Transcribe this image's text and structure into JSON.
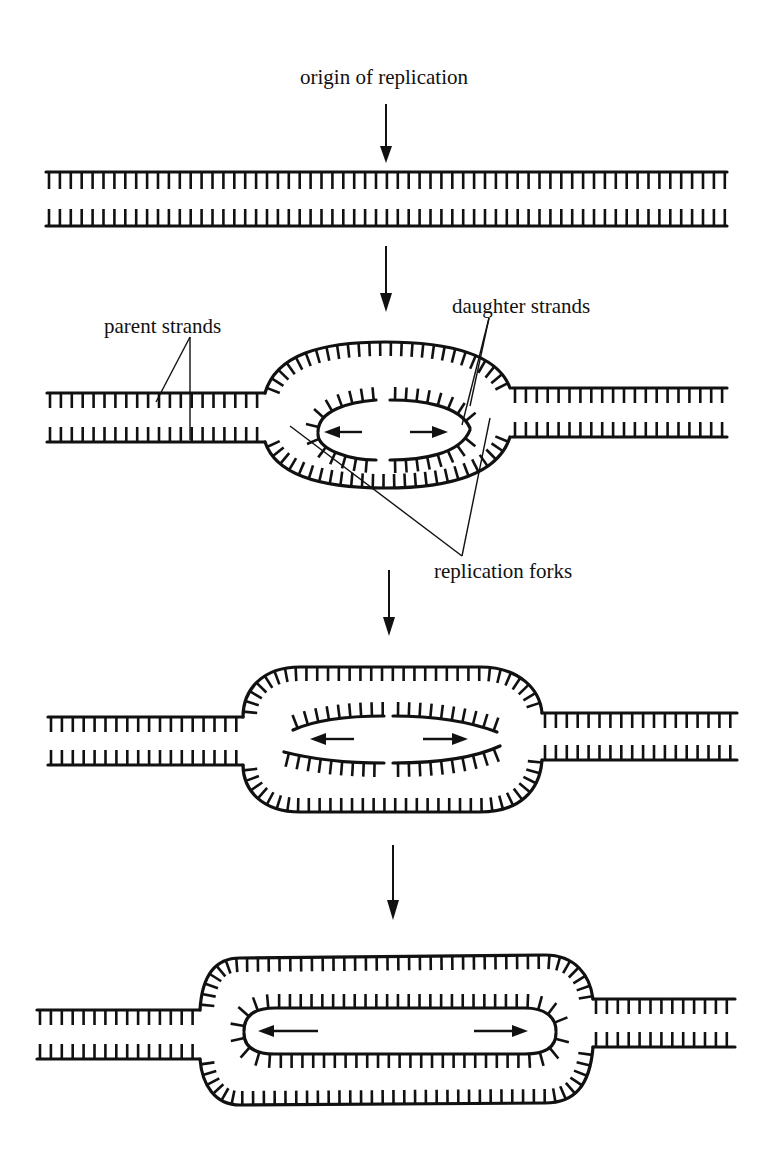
{
  "figure": {
    "labels": {
      "origin": "origin of replication",
      "parent": "parent strands",
      "daughter": "daughter strands",
      "forks": "replication forks"
    },
    "stages": [
      {
        "id": 1,
        "description": "Unreplicated double-stranded DNA with origin of replication marked"
      },
      {
        "id": 2,
        "description": "Replication bubble opens at origin; daughter strands synthesized bidirectionally"
      },
      {
        "id": 3,
        "description": "Bubble enlarges as replication forks move apart"
      },
      {
        "id": 4,
        "description": "Bubble further extended; daughter strands elongated"
      }
    ],
    "colors": {
      "ink": "#111111",
      "background": "#ffffff"
    }
  }
}
